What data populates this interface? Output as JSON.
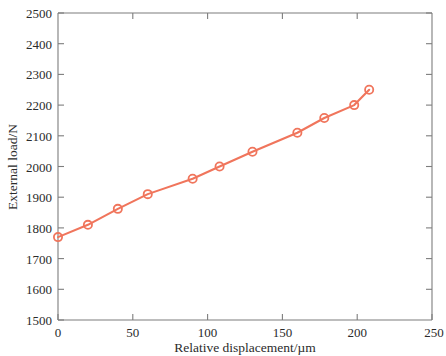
{
  "chart_data": {
    "type": "line",
    "title": "",
    "subtitle": "",
    "xlabel": "Relative displacement/µm",
    "ylabel": "External load/N",
    "xlim": [
      0,
      250
    ],
    "ylim": [
      1500,
      2500
    ],
    "xticks": [
      0,
      50,
      100,
      150,
      200,
      250
    ],
    "xtick_labels": [
      "0",
      "50",
      "100",
      "150",
      "200",
      "250"
    ],
    "yticks": [
      1500,
      1600,
      1700,
      1800,
      1900,
      2000,
      2100,
      2200,
      2300,
      2400,
      2500
    ],
    "ytick_labels": [
      "1500",
      "1600",
      "1700",
      "1800",
      "1900",
      "2000",
      "2100",
      "2200",
      "2300",
      "2400",
      "2500"
    ],
    "grid": false,
    "legend": null,
    "legend_position": "none",
    "series": [
      {
        "name": "External load vs relative displacement",
        "color": "#f0755c",
        "marker": "circle-open",
        "line_style": "solid",
        "x": [
          0,
          20,
          40,
          60,
          90,
          108,
          130,
          160,
          178,
          198,
          208
        ],
        "y": [
          1770,
          1810,
          1862,
          1910,
          1960,
          2000,
          2048,
          2110,
          2158,
          2200,
          2250
        ]
      }
    ],
    "annotations": []
  },
  "colors": {
    "series_accent": "#f0755c",
    "axis": "#7d7d7d",
    "text": "#2b2b2b",
    "background": "#ffffff"
  }
}
